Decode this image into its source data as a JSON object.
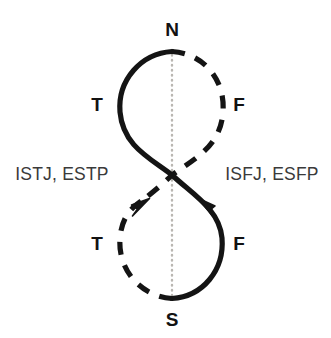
{
  "diagram": {
    "background_color": "#ffffff",
    "stroke_color": "#121212",
    "centerline_color": "#b8b5b0",
    "label_color": "#3a3a3a",
    "poles": {
      "top": "N",
      "bottom": "S",
      "upper_left": "T",
      "upper_right": "F",
      "lower_left": "T",
      "lower_right": "F"
    },
    "types": {
      "left": "ISTJ, ESTP",
      "right": "ISFJ, ESFP"
    },
    "strokes": [
      {
        "name": "upper-left-arc",
        "style": "solid",
        "from": "N",
        "to": "crossing"
      },
      {
        "name": "upper-right-arc",
        "style": "dashed",
        "from": "N",
        "to": "crossing"
      },
      {
        "name": "lower-left-arc",
        "style": "dashed",
        "from": "S",
        "to": "crossing",
        "arrowhead": true
      },
      {
        "name": "lower-right-arc",
        "style": "solid",
        "from": "S",
        "to": "crossing",
        "arrowhead": true
      },
      {
        "name": "center-axis",
        "style": "dotted",
        "from": "N",
        "to": "S"
      }
    ],
    "crossing_point": {
      "x": 172,
      "y": 175
    }
  }
}
